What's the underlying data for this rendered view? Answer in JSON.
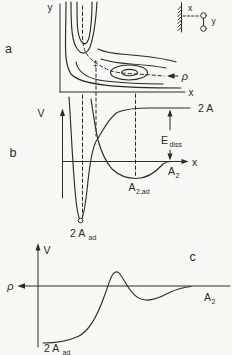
{
  "figure": {
    "type": "potential-energy-diagram",
    "description_visible_panels": [
      "a",
      "b",
      "c"
    ]
  },
  "colors": {
    "ink": "#2b2b26",
    "background": "#f7f7f4"
  },
  "panels": {
    "a": {
      "label": "a",
      "y_axis": "y",
      "x_axis": "x",
      "rho": "ρ",
      "transition_state": "‡",
      "inset": {
        "x_label": "x",
        "y_label": "y"
      }
    },
    "b": {
      "label": "b",
      "v_axis": "V",
      "x_axis": "x",
      "level_2a": "2 A",
      "e_diss_base": "E",
      "e_diss_sub": "diss",
      "a2_base": "A",
      "a2_sub": "2",
      "a2ad_base": "A",
      "a2ad_sub": "2,ad",
      "twoaad_base": "2 A",
      "twoaad_sub": "ad"
    },
    "c": {
      "label": "c",
      "v_axis": "V",
      "rho": "ρ",
      "a2_base": "A",
      "a2_sub": "2",
      "twoaad_base": "2 A",
      "twoaad_sub": "ad"
    }
  }
}
